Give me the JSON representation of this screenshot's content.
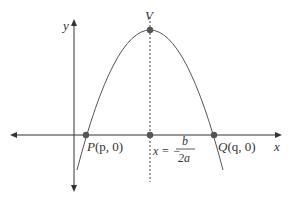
{
  "diagram": {
    "type": "parabola-graph",
    "axes": {
      "x_label": "x",
      "y_label": "y"
    },
    "vertex": {
      "label": "V"
    },
    "points": [
      {
        "name": "P",
        "coords": "(p, 0)"
      },
      {
        "name": "Q",
        "coords": "(q, 0)"
      }
    ],
    "axis_of_symmetry": {
      "lhs": "x = −",
      "numerator": "b",
      "denominator": "2a"
    },
    "colors": {
      "curve": "#555555",
      "points": "#555555",
      "axes": "#333333"
    }
  }
}
